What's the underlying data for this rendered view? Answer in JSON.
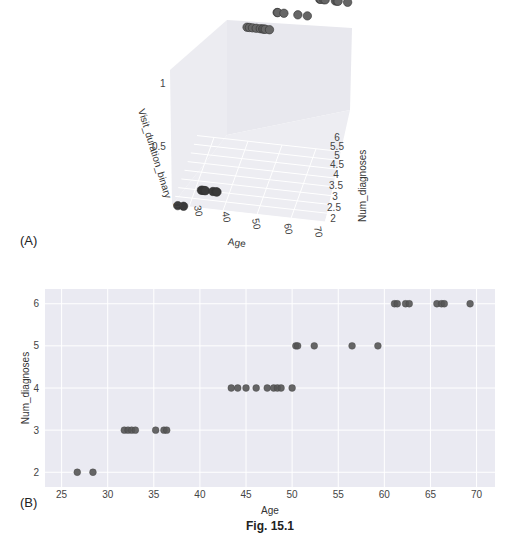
{
  "figure": {
    "caption": "Fig. 15.1",
    "panel_a_label": "(A)",
    "panel_b_label": "(B)"
  },
  "chart_data": [
    {
      "type": "scatter",
      "panel": "A",
      "projection": "3d",
      "title": "",
      "xlabel": "Age",
      "ylabel": "Num_diagnoses",
      "zlabel": "Visit_duration_binary",
      "x_ticks": [
        "30",
        "40",
        "50",
        "60",
        "70"
      ],
      "y_ticks": [
        "2",
        "2.5",
        "3",
        "3.5",
        "4",
        "4.5",
        "5",
        "5.5",
        "6"
      ],
      "z_ticks": [
        "0",
        "0.5",
        "1"
      ],
      "xlim": [
        25,
        70
      ],
      "ylim": [
        2,
        6
      ],
      "zlim": [
        0,
        1
      ],
      "points": [
        {
          "age": 26.7,
          "num_diagnoses": 2,
          "visit_duration_binary": 0
        },
        {
          "age": 28.4,
          "num_diagnoses": 2,
          "visit_duration_binary": 0
        },
        {
          "age": 31.8,
          "num_diagnoses": 3,
          "visit_duration_binary": 0
        },
        {
          "age": 32.2,
          "num_diagnoses": 3,
          "visit_duration_binary": 0
        },
        {
          "age": 32.6,
          "num_diagnoses": 3,
          "visit_duration_binary": 0
        },
        {
          "age": 33.0,
          "num_diagnoses": 3,
          "visit_duration_binary": 0
        },
        {
          "age": 35.2,
          "num_diagnoses": 3,
          "visit_duration_binary": 0
        },
        {
          "age": 36.1,
          "num_diagnoses": 3,
          "visit_duration_binary": 0
        },
        {
          "age": 36.4,
          "num_diagnoses": 3,
          "visit_duration_binary": 0
        },
        {
          "age": 43.4,
          "num_diagnoses": 4,
          "visit_duration_binary": 1
        },
        {
          "age": 44.1,
          "num_diagnoses": 4,
          "visit_duration_binary": 1
        },
        {
          "age": 45.0,
          "num_diagnoses": 4,
          "visit_duration_binary": 1
        },
        {
          "age": 46.1,
          "num_diagnoses": 4,
          "visit_duration_binary": 1
        },
        {
          "age": 47.3,
          "num_diagnoses": 4,
          "visit_duration_binary": 1
        },
        {
          "age": 48.0,
          "num_diagnoses": 4,
          "visit_duration_binary": 1
        },
        {
          "age": 48.4,
          "num_diagnoses": 4,
          "visit_duration_binary": 1
        },
        {
          "age": 48.8,
          "num_diagnoses": 4,
          "visit_duration_binary": 1
        },
        {
          "age": 50.0,
          "num_diagnoses": 4,
          "visit_duration_binary": 1
        },
        {
          "age": 50.4,
          "num_diagnoses": 5,
          "visit_duration_binary": 1
        },
        {
          "age": 50.6,
          "num_diagnoses": 5,
          "visit_duration_binary": 1
        },
        {
          "age": 52.4,
          "num_diagnoses": 5,
          "visit_duration_binary": 1
        },
        {
          "age": 56.5,
          "num_diagnoses": 5,
          "visit_duration_binary": 1
        },
        {
          "age": 59.3,
          "num_diagnoses": 5,
          "visit_duration_binary": 1
        },
        {
          "age": 61.1,
          "num_diagnoses": 6,
          "visit_duration_binary": 1
        },
        {
          "age": 61.4,
          "num_diagnoses": 6,
          "visit_duration_binary": 1
        },
        {
          "age": 62.3,
          "num_diagnoses": 6,
          "visit_duration_binary": 1
        },
        {
          "age": 62.7,
          "num_diagnoses": 6,
          "visit_duration_binary": 1
        },
        {
          "age": 65.7,
          "num_diagnoses": 6,
          "visit_duration_binary": 1
        },
        {
          "age": 66.2,
          "num_diagnoses": 6,
          "visit_duration_binary": 1
        },
        {
          "age": 66.5,
          "num_diagnoses": 6,
          "visit_duration_binary": 1
        },
        {
          "age": 69.3,
          "num_diagnoses": 6,
          "visit_duration_binary": 1
        }
      ],
      "grid": true,
      "marker_color": "#555555"
    },
    {
      "type": "scatter",
      "panel": "B",
      "title": "",
      "xlabel": "Age",
      "ylabel": "Num_diagnoses",
      "x_ticks": [
        25,
        30,
        35,
        40,
        45,
        50,
        55,
        60,
        65,
        70
      ],
      "y_ticks": [
        2,
        3,
        4,
        5,
        6
      ],
      "xlim": [
        23.2,
        72
      ],
      "ylim": [
        1.65,
        6.35
      ],
      "x": [
        26.7,
        28.4,
        31.8,
        32.2,
        32.6,
        33.0,
        35.2,
        36.1,
        36.4,
        43.4,
        44.1,
        45.0,
        46.1,
        47.3,
        48.0,
        48.4,
        48.8,
        50.0,
        50.4,
        50.6,
        52.4,
        56.5,
        59.3,
        61.1,
        61.4,
        62.3,
        62.7,
        65.7,
        66.2,
        66.5,
        69.3
      ],
      "y": [
        2,
        2,
        3,
        3,
        3,
        3,
        3,
        3,
        3,
        4,
        4,
        4,
        4,
        4,
        4,
        4,
        4,
        4,
        5,
        5,
        5,
        5,
        5,
        6,
        6,
        6,
        6,
        6,
        6,
        6,
        6
      ],
      "grid": true,
      "background": "#eaeaf2",
      "marker_color": "#555555"
    }
  ]
}
